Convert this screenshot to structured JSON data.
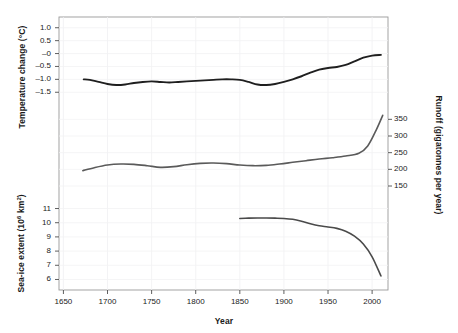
{
  "chart_data": {
    "type": "line",
    "title": "",
    "xlabel": "Year",
    "panels": [
      {
        "name": "temperature",
        "ylabel": "Temperature change (°C)",
        "ytick_labels": [
          "1.0",
          "0.5",
          "–0",
          "–0.5",
          "–1.0",
          "–1.5"
        ],
        "ytick_values": [
          1.0,
          0.5,
          0.0,
          -0.5,
          -1.0,
          -1.5
        ],
        "ylim": [
          -1.8,
          1.3
        ],
        "color": "#1f1f1f",
        "x": [
          1673,
          1680,
          1690,
          1700,
          1710,
          1720,
          1730,
          1740,
          1750,
          1760,
          1770,
          1780,
          1790,
          1800,
          1810,
          1820,
          1830,
          1840,
          1850,
          1860,
          1870,
          1880,
          1890,
          1900,
          1910,
          1920,
          1930,
          1940,
          1950,
          1960,
          1970,
          1980,
          1990,
          2000,
          2010
        ],
        "y": [
          -1.0,
          -1.02,
          -1.1,
          -1.18,
          -1.22,
          -1.2,
          -1.14,
          -1.1,
          -1.08,
          -1.1,
          -1.12,
          -1.1,
          -1.08,
          -1.06,
          -1.04,
          -1.02,
          -1.0,
          -1.0,
          -1.02,
          -1.1,
          -1.2,
          -1.22,
          -1.18,
          -1.1,
          -1.0,
          -0.88,
          -0.74,
          -0.62,
          -0.56,
          -0.52,
          -0.44,
          -0.3,
          -0.16,
          -0.08,
          -0.05
        ]
      },
      {
        "name": "runoff",
        "ylabel": "Runoff (gigatonnes per year)",
        "ytick_labels": [
          "350",
          "300",
          "250",
          "200",
          "150"
        ],
        "ytick_values": [
          350,
          300,
          250,
          200,
          150
        ],
        "ylim": [
          120,
          390
        ],
        "axis_side": "right",
        "color": "#5a5a5a",
        "x": [
          1672,
          1685,
          1700,
          1715,
          1730,
          1745,
          1760,
          1775,
          1790,
          1805,
          1820,
          1835,
          1850,
          1865,
          1880,
          1895,
          1910,
          1925,
          1940,
          1955,
          1970,
          1985,
          1995,
          2005,
          2012
        ],
        "y": [
          196,
          205,
          213,
          216,
          215,
          211,
          206,
          208,
          214,
          218,
          219,
          217,
          213,
          211,
          212,
          216,
          221,
          226,
          231,
          235,
          240,
          248,
          270,
          320,
          362
        ]
      },
      {
        "name": "sea-ice",
        "ylabel": "Sea-ice extent (10⁶ km²)",
        "ytick_labels": [
          "11",
          "10",
          "9",
          "8",
          "7",
          "6"
        ],
        "ytick_values": [
          11,
          10,
          9,
          8,
          7,
          6
        ],
        "ylim": [
          5.4,
          11.6
        ],
        "color": "#4a4a4a",
        "x": [
          1850,
          1860,
          1870,
          1880,
          1890,
          1900,
          1910,
          1920,
          1930,
          1940,
          1950,
          1960,
          1970,
          1980,
          1990,
          2000,
          2010
        ],
        "y": [
          10.3,
          10.32,
          10.33,
          10.33,
          10.32,
          10.3,
          10.24,
          10.1,
          9.92,
          9.78,
          9.7,
          9.6,
          9.4,
          9.05,
          8.5,
          7.6,
          6.25
        ]
      }
    ],
    "xtick_labels": [
      "1650",
      "1700",
      "1750",
      "1800",
      "1850",
      "1900",
      "1950",
      "2000"
    ],
    "xtick_values": [
      1650,
      1700,
      1750,
      1800,
      1850,
      1900,
      1950,
      2000
    ],
    "xlim": [
      1645,
      2018
    ],
    "grid": true,
    "legend": "none"
  }
}
